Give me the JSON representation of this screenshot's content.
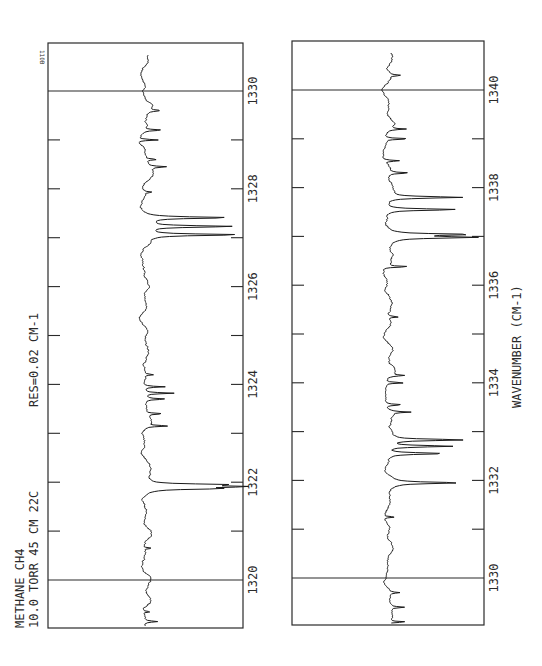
{
  "figure_id_label": "110B",
  "annotations": {
    "sample_line1": "METHANE   CH4",
    "sample_line2": "10.0 TORR  45 CM  22C",
    "resolution": "RES=0.02  CM-1",
    "x_axis_label": "WAVENUMBER (CM-1)"
  },
  "colors": {
    "ink": "#1a1a1a",
    "frame": "#2a2a2a",
    "background": "#ffffff"
  },
  "chart_data": [
    {
      "type": "line",
      "title": "",
      "xlabel": "WAVENUMBER (CM-1)",
      "ylabel": "Transmittance (relative)",
      "orientation": "rotated 90 degrees (wavenumber increases upward)",
      "xlim": [
        1319.0,
        1331.0
      ],
      "major_ticks": [
        1320,
        1322,
        1324,
        1326,
        1328,
        1330
      ],
      "minor_ticks": [
        1321,
        1323,
        1325,
        1327,
        1329
      ],
      "tick_labels": [
        "1320",
        "1322",
        "1324",
        "1326",
        "1328",
        "1330"
      ],
      "reference_lines": [
        1320,
        1330
      ],
      "grid": false,
      "baseline": 0.0,
      "absorption_lines": [
        {
          "x": 1319.15,
          "depth": 0.12
        },
        {
          "x": 1319.35,
          "depth": 0.08
        },
        {
          "x": 1320.65,
          "depth": 0.09
        },
        {
          "x": 1321.87,
          "depth": 0.62
        },
        {
          "x": 1321.91,
          "depth": 0.85
        },
        {
          "x": 1321.95,
          "depth": 0.7
        },
        {
          "x": 1323.15,
          "depth": 0.22
        },
        {
          "x": 1323.4,
          "depth": 0.18
        },
        {
          "x": 1323.7,
          "depth": 0.2
        },
        {
          "x": 1323.82,
          "depth": 0.3
        },
        {
          "x": 1323.95,
          "depth": 0.22
        },
        {
          "x": 1324.2,
          "depth": 0.08
        },
        {
          "x": 1327.06,
          "depth": 0.95
        },
        {
          "x": 1327.23,
          "depth": 0.88
        },
        {
          "x": 1327.41,
          "depth": 0.82
        },
        {
          "x": 1327.93,
          "depth": 0.08
        },
        {
          "x": 1328.45,
          "depth": 0.18
        },
        {
          "x": 1328.6,
          "depth": 0.12
        },
        {
          "x": 1329.0,
          "depth": 0.22
        },
        {
          "x": 1329.2,
          "depth": 0.18
        },
        {
          "x": 1329.6,
          "depth": 0.12
        }
      ]
    },
    {
      "type": "line",
      "title": "",
      "xlabel": "WAVENUMBER (CM-1)",
      "ylabel": "Transmittance (relative)",
      "orientation": "rotated 90 degrees (wavenumber increases upward)",
      "xlim": [
        1329.0,
        1341.0
      ],
      "major_ticks": [
        1330,
        1332,
        1334,
        1336,
        1338,
        1340
      ],
      "minor_ticks": [
        1331,
        1333,
        1335,
        1337,
        1339
      ],
      "tick_labels": [
        "1330",
        "1332",
        "1334",
        "1336",
        "1338",
        "1340"
      ],
      "reference_lines": [
        1330,
        1340
      ],
      "grid": false,
      "baseline": 0.0,
      "absorption_lines": [
        {
          "x": 1329.1,
          "depth": 0.2
        },
        {
          "x": 1329.4,
          "depth": 0.15
        },
        {
          "x": 1329.7,
          "depth": 0.12
        },
        {
          "x": 1331.25,
          "depth": 0.12
        },
        {
          "x": 1331.95,
          "depth": 0.7
        },
        {
          "x": 1332.55,
          "depth": 0.62
        },
        {
          "x": 1332.7,
          "depth": 0.72
        },
        {
          "x": 1332.83,
          "depth": 0.8
        },
        {
          "x": 1333.4,
          "depth": 0.22
        },
        {
          "x": 1333.55,
          "depth": 0.18
        },
        {
          "x": 1334.0,
          "depth": 0.2
        },
        {
          "x": 1334.15,
          "depth": 0.15
        },
        {
          "x": 1335.35,
          "depth": 0.12
        },
        {
          "x": 1336.38,
          "depth": 0.26
        },
        {
          "x": 1336.98,
          "depth": 0.88
        },
        {
          "x": 1337.04,
          "depth": 0.82
        },
        {
          "x": 1337.55,
          "depth": 0.78
        },
        {
          "x": 1337.8,
          "depth": 0.8
        },
        {
          "x": 1338.3,
          "depth": 0.22
        },
        {
          "x": 1338.55,
          "depth": 0.16
        },
        {
          "x": 1339.0,
          "depth": 0.28
        },
        {
          "x": 1339.2,
          "depth": 0.18
        },
        {
          "x": 1340.3,
          "depth": 0.12
        }
      ]
    }
  ]
}
